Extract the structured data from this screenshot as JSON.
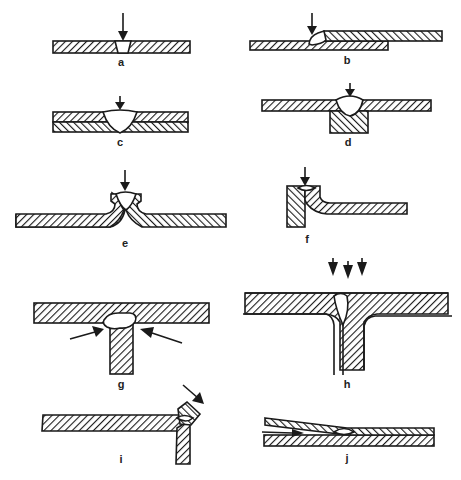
{
  "figure": {
    "colors": {
      "ink": "#1a1a1a",
      "background": "#ffffff"
    },
    "panels": [
      {
        "id": "a",
        "label": "a",
        "description": "Butt joint, single plate with groove weld, vertical arrow"
      },
      {
        "id": "b",
        "label": "b",
        "description": "Lap joint, fillet weld at overlap step, vertical arrow"
      },
      {
        "id": "c",
        "label": "c",
        "description": "Two stacked plates with full-depth groove weld, vertical arrow"
      },
      {
        "id": "d",
        "label": "d",
        "description": "Plate on backing block with groove weld, vertical arrow"
      },
      {
        "id": "e",
        "label": "e",
        "description": "Edge (flanged) joint with upturned edges, vertical arrow"
      },
      {
        "id": "f",
        "label": "f",
        "description": "Corner flange joint, vertical arrow"
      },
      {
        "id": "g",
        "label": "g",
        "description": "T-joint with double fillet, two angled arrows"
      },
      {
        "id": "h",
        "label": "h",
        "description": "T-joint with flanged web, three vertical arrows"
      },
      {
        "id": "i",
        "label": "i",
        "description": "Corner joint at plate end, angled arrow"
      },
      {
        "id": "j",
        "label": "j",
        "description": "Tapered lap joint with internal weld"
      }
    ]
  }
}
